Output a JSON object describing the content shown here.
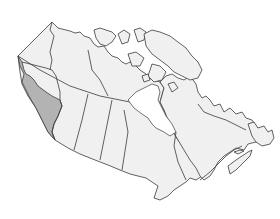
{
  "map": {
    "country": "Canada",
    "highlighted_region": "British Columbia",
    "colors": {
      "land": "#f0f0f0",
      "highlight": "#b3b3b3",
      "border": "#3a3a3a",
      "background": "#ffffff"
    },
    "regions": [
      {
        "id": "yukon",
        "name": "Yukon",
        "highlighted": false
      },
      {
        "id": "northwest-territories",
        "name": "Northwest Territories",
        "highlighted": false
      },
      {
        "id": "nunavut",
        "name": "Nunavut",
        "highlighted": false
      },
      {
        "id": "british-columbia",
        "name": "British Columbia",
        "highlighted": true
      },
      {
        "id": "alberta",
        "name": "Alberta",
        "highlighted": false
      },
      {
        "id": "saskatchewan",
        "name": "Saskatchewan",
        "highlighted": false
      },
      {
        "id": "manitoba",
        "name": "Manitoba",
        "highlighted": false
      },
      {
        "id": "ontario",
        "name": "Ontario",
        "highlighted": false
      },
      {
        "id": "quebec",
        "name": "Quebec",
        "highlighted": false
      },
      {
        "id": "newfoundland-and-labrador",
        "name": "Newfoundland and Labrador",
        "highlighted": false
      },
      {
        "id": "new-brunswick",
        "name": "New Brunswick",
        "highlighted": false
      },
      {
        "id": "nova-scotia",
        "name": "Nova Scotia",
        "highlighted": false
      },
      {
        "id": "prince-edward-island",
        "name": "Prince Edward Island",
        "highlighted": false
      }
    ]
  }
}
